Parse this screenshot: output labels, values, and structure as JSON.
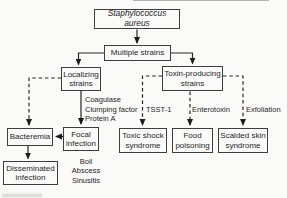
{
  "figure": {
    "root_label": "Staphylococcus aureus",
    "nodes": {
      "multiple_strains": "Multiple strains",
      "localizing_strains": "Localizing\nstrains",
      "toxin_producing_strains": "Toxin-producing\nstrains",
      "bacteremia": "Bacteremia",
      "focal_infection": "Focal\ninfection",
      "toxic_shock_syndrome": "Toxic shock\nsyndrome",
      "food_poisoning": "Food\npoisoning",
      "scalded_skin_syndrome": "Scalded skin\nsyndrome",
      "disseminated_infection": "Disseminated\ninfection"
    },
    "edge_labels": {
      "virulence_factors": "Coagulase\nClumping factor\nProtein A",
      "tsst": "TSST-1",
      "enterotoxin": "Enterotoxin",
      "exfoliation": "Exfoliation"
    },
    "annotations": {
      "focal_examples": "Boil\nAbscess\nSinusitis"
    },
    "colors": {
      "line": "#262626",
      "box_border": "#3d3d3d",
      "text": "#1f1f1f",
      "background": "#fafaf8"
    }
  }
}
